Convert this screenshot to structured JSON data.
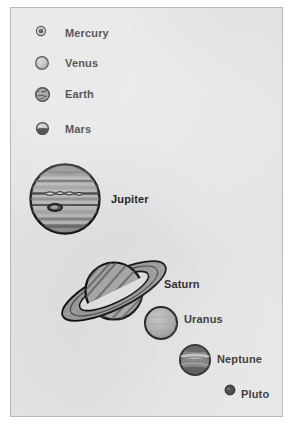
{
  "figure": {
    "background_color": "#e2e2e2",
    "frame_color": "#b9b9b9",
    "ink_color": "#151515"
  },
  "planets": [
    {
      "name": "Mercury",
      "label": "Mercury",
      "icon": "planet-disc-mercury",
      "diameter_px": 9,
      "cx": 39,
      "cy": 31,
      "label_x": 64,
      "label_y": 27,
      "shading": "dark-core-light-rim",
      "body_color": "#8d8d8d",
      "outline_color": "#161616"
    },
    {
      "name": "Venus",
      "label": "Venus",
      "icon": "planet-disc-venus",
      "diameter_px": 13,
      "cx": 40,
      "cy": 61,
      "label_x": 64,
      "label_y": 57,
      "shading": "light-with-soft-terminator",
      "body_color": "#b0b0b0",
      "outline_color": "#161616"
    },
    {
      "name": "Earth",
      "label": "Earth",
      "icon": "planet-disc-earth",
      "diameter_px": 14,
      "cx": 41,
      "cy": 92,
      "label_x": 64,
      "label_y": 88,
      "shading": "mottled-continents",
      "body_color": "#6f6f6f",
      "outline_color": "#111111"
    },
    {
      "name": "Mars",
      "label": "Mars",
      "icon": "planet-disc-mars",
      "diameter_px": 12,
      "cx": 41,
      "cy": 126,
      "label_x": 64,
      "label_y": 122,
      "shading": "light-top-dark-bottom",
      "body_color": "#9e9e9e",
      "outline_color": "#111111"
    },
    {
      "name": "Jupiter",
      "label": "Jupiter",
      "icon": "planet-disc-jupiter",
      "diameter_px": 70,
      "cx": 62,
      "cy": 198,
      "label_x": 110,
      "label_y": 192,
      "shading": "horizontal-cloud-bands-with-great-red-spot",
      "body_color": "#a3a3a3",
      "outline_color": "#111111"
    },
    {
      "name": "Saturn",
      "label": "Saturn",
      "icon": "planet-disc-saturn-with-rings",
      "diameter_px": 58,
      "cx": 112,
      "cy": 283,
      "ring_outer_px": 118,
      "ring_tilt_deg": -26,
      "label_x": 163,
      "label_y": 277,
      "shading": "diagonal-bands",
      "body_color": "#9b9b9b",
      "outline_color": "#111111"
    },
    {
      "name": "Uranus",
      "label": "Uranus",
      "icon": "planet-disc-uranus",
      "diameter_px": 33,
      "cx": 158,
      "cy": 323,
      "label_x": 183,
      "label_y": 312,
      "shading": "even-gray-with-dark-rim",
      "body_color": "#a6a6a6",
      "outline_color": "#111111"
    },
    {
      "name": "Neptune",
      "label": "Neptune",
      "icon": "planet-disc-neptune",
      "diameter_px": 31,
      "cx": 192,
      "cy": 360,
      "label_x": 216,
      "label_y": 352,
      "shading": "dark-with-light-equatorial-streak",
      "body_color": "#6b6b6b",
      "outline_color": "#0e0e0e"
    },
    {
      "name": "Pluto",
      "label": "Pluto",
      "icon": "planet-disc-pluto",
      "diameter_px": 9,
      "cx": 228,
      "cy": 391,
      "label_x": 240,
      "label_y": 387,
      "shading": "solid-dark",
      "body_color": "#2a2a2a",
      "outline_color": "#0e0e0e"
    }
  ]
}
